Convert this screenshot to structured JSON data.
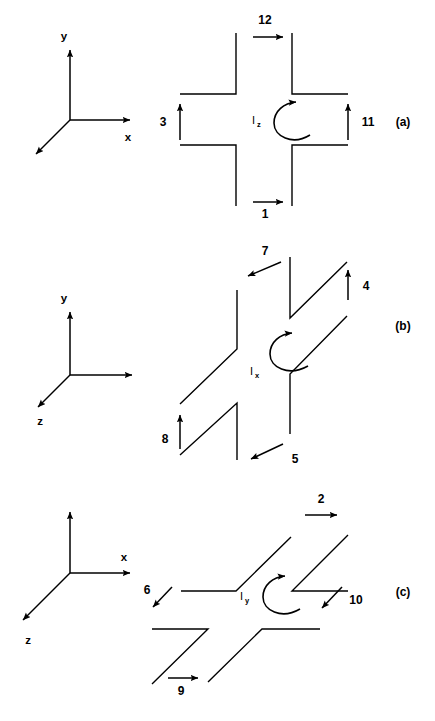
{
  "figure": {
    "background_color": "#ffffff",
    "line_color": "#000000",
    "width": 435,
    "height": 721
  },
  "panels": [
    {
      "id": "a",
      "panel_label": "(a)",
      "current_symbol": "I",
      "current_subscript": "z",
      "rotation_sense": "counterclockwise",
      "axes": {
        "vertical_label": "y",
        "horizontal_label": "x",
        "diagonal_label": ""
      },
      "branch_labels": [
        {
          "name": "top",
          "text": "12",
          "arrow_direction": "right"
        },
        {
          "name": "left",
          "text": "3",
          "arrow_direction": "up"
        },
        {
          "name": "right",
          "text": "11",
          "arrow_direction": "up"
        },
        {
          "name": "bottom",
          "text": "1",
          "arrow_direction": "right"
        }
      ]
    },
    {
      "id": "b",
      "panel_label": "(b)",
      "current_symbol": "I",
      "current_subscript": "x",
      "rotation_sense": "counterclockwise",
      "axes": {
        "vertical_label": "y",
        "horizontal_label": "",
        "diagonal_label": "z"
      },
      "branch_labels": [
        {
          "name": "top",
          "text": "7",
          "arrow_direction": "down-left"
        },
        {
          "name": "right",
          "text": "4",
          "arrow_direction": "up"
        },
        {
          "name": "left",
          "text": "8",
          "arrow_direction": "up"
        },
        {
          "name": "bottom",
          "text": "5",
          "arrow_direction": "down-left"
        }
      ]
    },
    {
      "id": "c",
      "panel_label": "(c)",
      "current_symbol": "I",
      "current_subscript": "y",
      "rotation_sense": "counterclockwise",
      "axes": {
        "vertical_label": "",
        "horizontal_label": "x",
        "diagonal_label": "z"
      },
      "branch_labels": [
        {
          "name": "top",
          "text": "2",
          "arrow_direction": "right"
        },
        {
          "name": "left",
          "text": "6",
          "arrow_direction": "down-left"
        },
        {
          "name": "right",
          "text": "10",
          "arrow_direction": "down-left"
        },
        {
          "name": "bottom",
          "text": "9",
          "arrow_direction": "right"
        }
      ]
    }
  ]
}
